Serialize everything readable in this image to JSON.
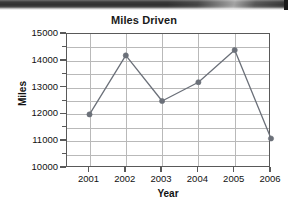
{
  "artifact": {
    "name": "scan-edge-artifact",
    "description": "dark scanner shadow band across top of page"
  },
  "chart_data": {
    "type": "line",
    "title": "Miles Driven",
    "xlabel": "Year",
    "ylabel": "Miles",
    "categories": [
      "2001",
      "2002",
      "2003",
      "2004",
      "2005",
      "2006"
    ],
    "values": [
      12000,
      14200,
      12500,
      13200,
      14400,
      11100
    ],
    "ylim": [
      10000,
      15000
    ],
    "ytick_labels": [
      "10000",
      "11000",
      "12000",
      "13000",
      "14000",
      "15000"
    ],
    "ytick_values": [
      10000,
      11000,
      12000,
      13000,
      14000,
      15000
    ],
    "yminor_values": [
      10500,
      11500,
      12500,
      13500,
      14500
    ],
    "grid": true,
    "grid_axes": "both",
    "legend": "none",
    "marker": "circle",
    "series": [
      {
        "name": "Miles Driven",
        "values": [
          12000,
          14200,
          12500,
          13200,
          14400,
          11100
        ]
      }
    ],
    "colors": {
      "line": "#6b7079",
      "marker": "#6b7079",
      "grid": "#b9b9b9",
      "frame": "#595959",
      "text": "#111111"
    }
  }
}
